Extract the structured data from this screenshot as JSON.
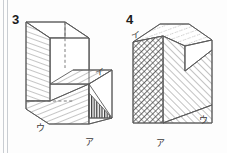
{
  "page": {
    "width": 227,
    "height": 153,
    "background_color": "#fdfdfd",
    "binding_lines_color": "#c9cdd2"
  },
  "figures": [
    {
      "id": "figure-3",
      "number": "3",
      "number_pos": {
        "x": 12,
        "y": 24
      },
      "description": "Open rectangular box (three-dimensional shape) with a shaded inner wall, a shaded floor panel, a hidden dashed vertical edge, and a small densely shaded right triangle at the lower right.",
      "labels": [
        {
          "name": "label-i",
          "text": "イ",
          "x": 95,
          "y": 75
        },
        {
          "name": "label-u",
          "text": "ウ",
          "x": 36,
          "y": 131
        },
        {
          "name": "label-a",
          "text": "ア",
          "x": 85,
          "y": 145
        }
      ],
      "hatching": {
        "left_wall": "diagonal-light",
        "floor_panel": "diagonal-light",
        "inner_shelf": "diagonal-light",
        "corner_triangle": "vertical-dense"
      }
    },
    {
      "id": "figure-4",
      "number": "4",
      "number_pos": {
        "x": 126,
        "y": 24
      },
      "description": "Solid block with a V-shaped notch cut into the upper right; the left front face is densely cross-hatched, the right face and top face are lightly hatched.",
      "labels": [
        {
          "name": "label-i",
          "text": "イ",
          "x": 131,
          "y": 38
        },
        {
          "name": "label-a",
          "text": "ア",
          "x": 156,
          "y": 146
        },
        {
          "name": "label-u",
          "text": "ウ",
          "x": 199,
          "y": 123
        }
      ],
      "hatching": {
        "front_face": "cross-hatch-dense",
        "right_face": "diagonal-light",
        "top_face": "diagonal-dotted"
      }
    }
  ],
  "colors": {
    "edge": "#5a5a5a",
    "hidden_edge": "#6d6d6d",
    "hatch": "#6f6f6f",
    "hatch_dense": "#3d3d3d",
    "label_text": "#3a3a3a",
    "number_text": "#1b1b1b",
    "face_fill": "#ffffff"
  }
}
